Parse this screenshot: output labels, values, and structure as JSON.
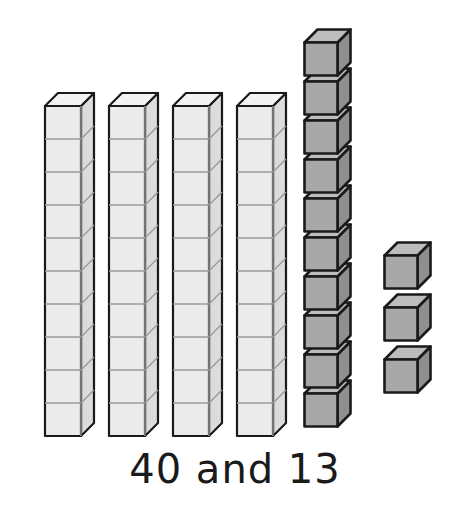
{
  "illustration": {
    "kind": "base-ten-blocks",
    "caption": "40 and 13",
    "colors": {
      "background": "#ffffff",
      "rod_front": "#ebebeb",
      "rod_top": "#f3f3f3",
      "rod_side": "#dcdcdc",
      "rod_outline": "#1a1a1a",
      "rod_grid": "#9a9a9a",
      "cube_front": "#a8a8a8",
      "cube_top": "#bdbdbd",
      "cube_side": "#8f8f8f",
      "cube_outline": "#1a1a1a",
      "text": "#1a1a1a"
    },
    "rods": [
      {
        "label": "ten-rod-1",
        "units": 10,
        "x": 44,
        "y": 92
      },
      {
        "label": "ten-rod-2",
        "units": 10,
        "x": 108,
        "y": 92
      },
      {
        "label": "ten-rod-3",
        "units": 10,
        "x": 172,
        "y": 92
      },
      {
        "label": "ten-rod-4",
        "units": 10,
        "x": 236,
        "y": 92
      }
    ],
    "cube_column": {
      "label": "unit-cube-column",
      "count": 10,
      "x": 303,
      "y": 28,
      "step": 39
    },
    "loose_cubes": [
      {
        "label": "loose-unit-cube-1",
        "x": 383,
        "y": 241
      },
      {
        "label": "loose-unit-cube-2",
        "x": 383,
        "y": 293
      },
      {
        "label": "loose-unit-cube-3",
        "x": 383,
        "y": 345
      }
    ],
    "totals": {
      "tens_value": 40,
      "ones_value": 13,
      "rod_count": 4,
      "units_per_rod": 10,
      "column_cube_count": 10,
      "loose_cube_count": 3
    }
  }
}
